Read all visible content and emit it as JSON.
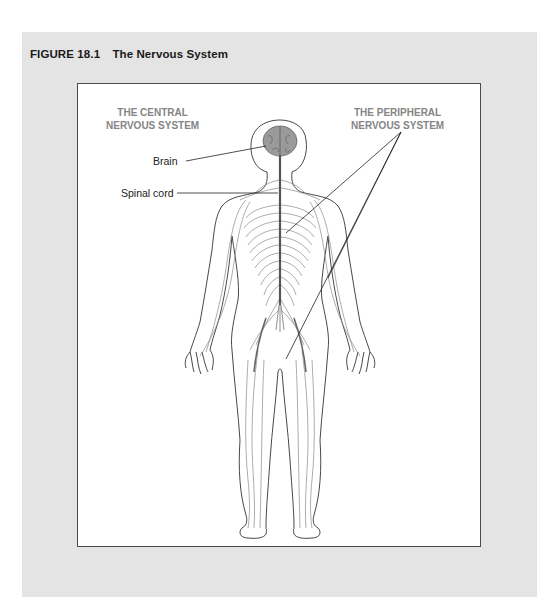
{
  "figure": {
    "number": "FIGURE 18.1",
    "title": "The Nervous System"
  },
  "headings": {
    "central": [
      "THE CENTRAL",
      "NERVOUS SYSTEM"
    ],
    "peripheral": [
      "THE PERIPHERAL",
      "NERVOUS SYSTEM"
    ]
  },
  "labels": {
    "brain": "Brain",
    "spinal_cord": "Spinal cord"
  },
  "colors": {
    "panel_background": "#e4e4e4",
    "frame_border": "#4a4a4a",
    "heading_text": "#858585",
    "body_outline": "#333333",
    "nerves": "#8a8a8a",
    "spinal_cord": "#555555",
    "brain_fill": "#9a9a9a"
  }
}
